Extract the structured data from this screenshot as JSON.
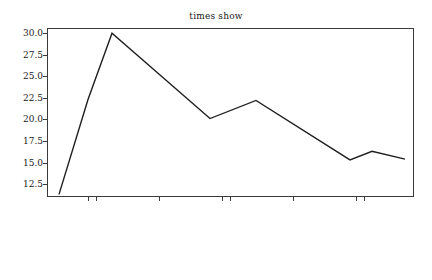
{
  "chart_data": {
    "type": "line",
    "title": "times show",
    "xlabel": "",
    "ylabel": "",
    "grid": false,
    "legend": null,
    "ylim": [
      11.0,
      30.6
    ],
    "yticks": [
      "12.5",
      "15.0",
      "17.5",
      "20.0",
      "22.5",
      "25.0",
      "27.5",
      "30.0"
    ],
    "ytick_values": [
      12.5,
      15.0,
      17.5,
      20.0,
      22.5,
      25.0,
      27.5,
      30.0
    ],
    "xticks": [
      "2020-02-29",
      "2020-03-01",
      "2020-03-15",
      "2020-03-29",
      "2020-04-01",
      "2020-04-15",
      "2020-04-29",
      "2020-04-01"
    ],
    "xtick_positions": [
      88,
      96,
      159,
      222,
      230,
      293,
      356,
      364
    ],
    "series": [
      {
        "name": "times",
        "line_color": "#1f1f1f",
        "x": [
          59,
          88,
          112,
          210,
          256,
          350,
          372,
          405
        ],
        "values": [
          11.3,
          22.3,
          30.0,
          20.1,
          22.2,
          15.3,
          16.3,
          15.4
        ]
      }
    ]
  },
  "plot": {
    "frame_color": "#3a3a3a"
  }
}
